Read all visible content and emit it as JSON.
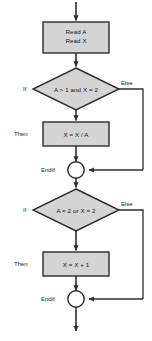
{
  "diagram": {
    "type": "flowchart",
    "colors": {
      "node_fill": "#d4d4d4",
      "node_stroke": "#2b2b2b",
      "connector": "#3a3a3a",
      "background": "#ffffff",
      "text": "#111111"
    },
    "nodes": [
      {
        "id": "entry-arrow",
        "shape": "arrow",
        "label": ""
      },
      {
        "id": "read-box",
        "shape": "process",
        "line1": "Read A",
        "line2": "Read X"
      },
      {
        "id": "decision-1",
        "shape": "decision",
        "condition": "A > 1 and X = 2",
        "branch_true": "If",
        "branch_false": "Else"
      },
      {
        "id": "process-1",
        "shape": "process",
        "statement": "X = X / A",
        "branch_label": "Then"
      },
      {
        "id": "endif-1",
        "shape": "connector",
        "label": "Endif"
      },
      {
        "id": "decision-2",
        "shape": "decision",
        "condition": "A = 2 or X = 2",
        "branch_true": "If",
        "branch_false": "Else"
      },
      {
        "id": "process-2",
        "shape": "process",
        "statement": "X = X + 1",
        "branch_label": "Then"
      },
      {
        "id": "endif-2",
        "shape": "connector",
        "label": "Endif"
      },
      {
        "id": "exit-arrow",
        "shape": "arrow",
        "label": ""
      }
    ]
  }
}
